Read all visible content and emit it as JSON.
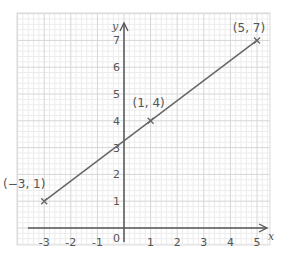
{
  "chart_data": {
    "type": "line",
    "title": "",
    "xlabel": "x",
    "ylabel": "y",
    "xlim": [
      -3.5,
      5.5
    ],
    "ylim": [
      -0.6,
      7.3
    ],
    "grid": true,
    "x_ticks": [
      -3,
      -2,
      -1,
      1,
      2,
      3,
      4,
      5
    ],
    "y_ticks": [
      1,
      2,
      3,
      4,
      5,
      6,
      7
    ],
    "origin_label": "0",
    "series": [
      {
        "name": "line",
        "x": [
          -3,
          1,
          5
        ],
        "y": [
          1,
          4,
          7
        ],
        "marker": "x"
      }
    ],
    "annotations": [
      {
        "text": "(−3, 1)",
        "x": -3,
        "y": 1
      },
      {
        "text": "(1, 4)",
        "x": 1,
        "y": 4
      },
      {
        "text": "(5, 7)",
        "x": 5,
        "y": 7
      }
    ]
  },
  "colors": {
    "grid_minor": "#ececec",
    "grid_major": "#d6d6d6",
    "axis": "#555555",
    "line": "#666666"
  }
}
